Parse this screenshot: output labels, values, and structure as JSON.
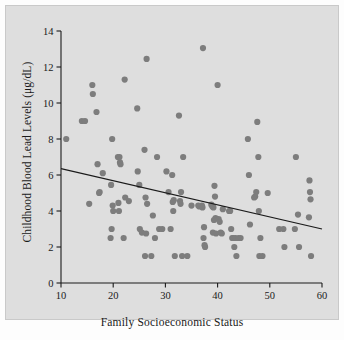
{
  "figure": {
    "width": 344,
    "height": 340,
    "panel_background": "#dedede",
    "page_background": "#fdfdfd"
  },
  "chart_data": {
    "type": "scatter",
    "title": "",
    "xlabel": "Family Socioeconomic Status",
    "ylabel": "Childhood Blood Lead Levels (μg/dL)",
    "xlim": [
      10,
      60
    ],
    "ylim": [
      0,
      14
    ],
    "xticks": [
      10,
      20,
      30,
      40,
      50,
      60
    ],
    "yticks": [
      0,
      2,
      4,
      6,
      8,
      10,
      12,
      14
    ],
    "xtick_labels": [
      "10",
      "20",
      "30",
      "40",
      "50",
      "60"
    ],
    "ytick_labels": [
      "0",
      "2",
      "4",
      "6",
      "8",
      "10",
      "12",
      "14"
    ],
    "grid": false,
    "legend": null,
    "marker_color": "#7d7d7d",
    "marker_size": 4.2,
    "line_color": "#1a1a1a",
    "trendline": {
      "label": "linear fit",
      "x": [
        10,
        60
      ],
      "y": [
        6.35,
        3.0
      ],
      "slope": -0.067,
      "intercept": 7.02
    },
    "series": [
      {
        "name": "Children",
        "n": 120,
        "points": [
          [
            11.0,
            8.0
          ],
          [
            14.0,
            9.0
          ],
          [
            14.6,
            9.0
          ],
          [
            15.4,
            4.4
          ],
          [
            16.0,
            11.0
          ],
          [
            16.1,
            10.5
          ],
          [
            16.8,
            9.5
          ],
          [
            17.0,
            6.6
          ],
          [
            17.3,
            5.0
          ],
          [
            17.4,
            5.05
          ],
          [
            18.0,
            6.1
          ],
          [
            19.8,
            8.0
          ],
          [
            19.6,
            5.45
          ],
          [
            19.9,
            4.3
          ],
          [
            20.0,
            4.0
          ],
          [
            19.7,
            3.0
          ],
          [
            19.5,
            2.5
          ],
          [
            20.9,
            7.0
          ],
          [
            21.2,
            7.0
          ],
          [
            21.3,
            6.7
          ],
          [
            21.4,
            6.6
          ],
          [
            21.0,
            4.45
          ],
          [
            21.1,
            4.0
          ],
          [
            22.2,
            11.3
          ],
          [
            22.3,
            4.75
          ],
          [
            22.0,
            2.5
          ],
          [
            23.0,
            4.55
          ],
          [
            24.6,
            9.7
          ],
          [
            24.7,
            6.2
          ],
          [
            25.0,
            5.45
          ],
          [
            25.1,
            3.0
          ],
          [
            25.5,
            2.8
          ],
          [
            26.4,
            12.45
          ],
          [
            26.0,
            7.4
          ],
          [
            26.2,
            4.75
          ],
          [
            26.5,
            4.4
          ],
          [
            26.3,
            2.75
          ],
          [
            26.1,
            1.5
          ],
          [
            27.3,
            1.5
          ],
          [
            27.6,
            3.75
          ],
          [
            28.0,
            2.5
          ],
          [
            28.4,
            7.0
          ],
          [
            28.8,
            3.0
          ],
          [
            29.4,
            3.0
          ],
          [
            30.2,
            6.2
          ],
          [
            30.6,
            5.05
          ],
          [
            31.3,
            6.0
          ],
          [
            31.6,
            4.6
          ],
          [
            31.4,
            4.5
          ],
          [
            31.5,
            4.0
          ],
          [
            31.0,
            3.0
          ],
          [
            31.8,
            1.5
          ],
          [
            32.6,
            9.3
          ],
          [
            32.8,
            4.55
          ],
          [
            32.9,
            4.4
          ],
          [
            33.0,
            5.05
          ],
          [
            33.2,
            1.5
          ],
          [
            33.4,
            7.0
          ],
          [
            34.2,
            1.5
          ],
          [
            35.0,
            4.3
          ],
          [
            36.3,
            4.3
          ],
          [
            36.5,
            4.25
          ],
          [
            37.2,
            13.05
          ],
          [
            37.0,
            4.3
          ],
          [
            37.1,
            4.2
          ],
          [
            37.4,
            3.1
          ],
          [
            37.3,
            2.5
          ],
          [
            37.5,
            2.1
          ],
          [
            37.6,
            2.0
          ],
          [
            38.8,
            4.35
          ],
          [
            39.0,
            4.25
          ],
          [
            39.2,
            4.2
          ],
          [
            39.4,
            5.4
          ],
          [
            39.5,
            4.8
          ],
          [
            39.6,
            3.6
          ],
          [
            39.3,
            3.5
          ],
          [
            39.1,
            2.8
          ],
          [
            39.7,
            2.75
          ],
          [
            40.0,
            11.0
          ],
          [
            40.2,
            3.55
          ],
          [
            40.4,
            3.4
          ],
          [
            40.6,
            2.8
          ],
          [
            40.8,
            2.75
          ],
          [
            41.0,
            4.1
          ],
          [
            42.2,
            4.0
          ],
          [
            42.4,
            4.0
          ],
          [
            42.6,
            3.0
          ],
          [
            42.8,
            2.5
          ],
          [
            43.0,
            2.5
          ],
          [
            43.4,
            2.5
          ],
          [
            43.2,
            2.0
          ],
          [
            43.6,
            1.5
          ],
          [
            44.0,
            2.5
          ],
          [
            44.4,
            2.5
          ],
          [
            45.8,
            8.0
          ],
          [
            46.0,
            6.0
          ],
          [
            46.2,
            3.25
          ],
          [
            47.6,
            8.95
          ],
          [
            47.8,
            7.0
          ],
          [
            47.4,
            5.05
          ],
          [
            47.2,
            4.8
          ],
          [
            47.0,
            4.75
          ],
          [
            47.9,
            4.0
          ],
          [
            48.2,
            2.5
          ],
          [
            48.0,
            1.5
          ],
          [
            48.6,
            1.5
          ],
          [
            49.6,
            5.0
          ],
          [
            51.8,
            3.0
          ],
          [
            52.6,
            3.0
          ],
          [
            52.8,
            2.0
          ],
          [
            55.0,
            7.0
          ],
          [
            54.8,
            3.0
          ],
          [
            55.4,
            3.8
          ],
          [
            55.6,
            2.0
          ],
          [
            57.6,
            5.7
          ],
          [
            57.7,
            5.05
          ],
          [
            57.8,
            4.65
          ],
          [
            57.5,
            3.65
          ],
          [
            57.9,
            1.5
          ]
        ]
      }
    ]
  }
}
